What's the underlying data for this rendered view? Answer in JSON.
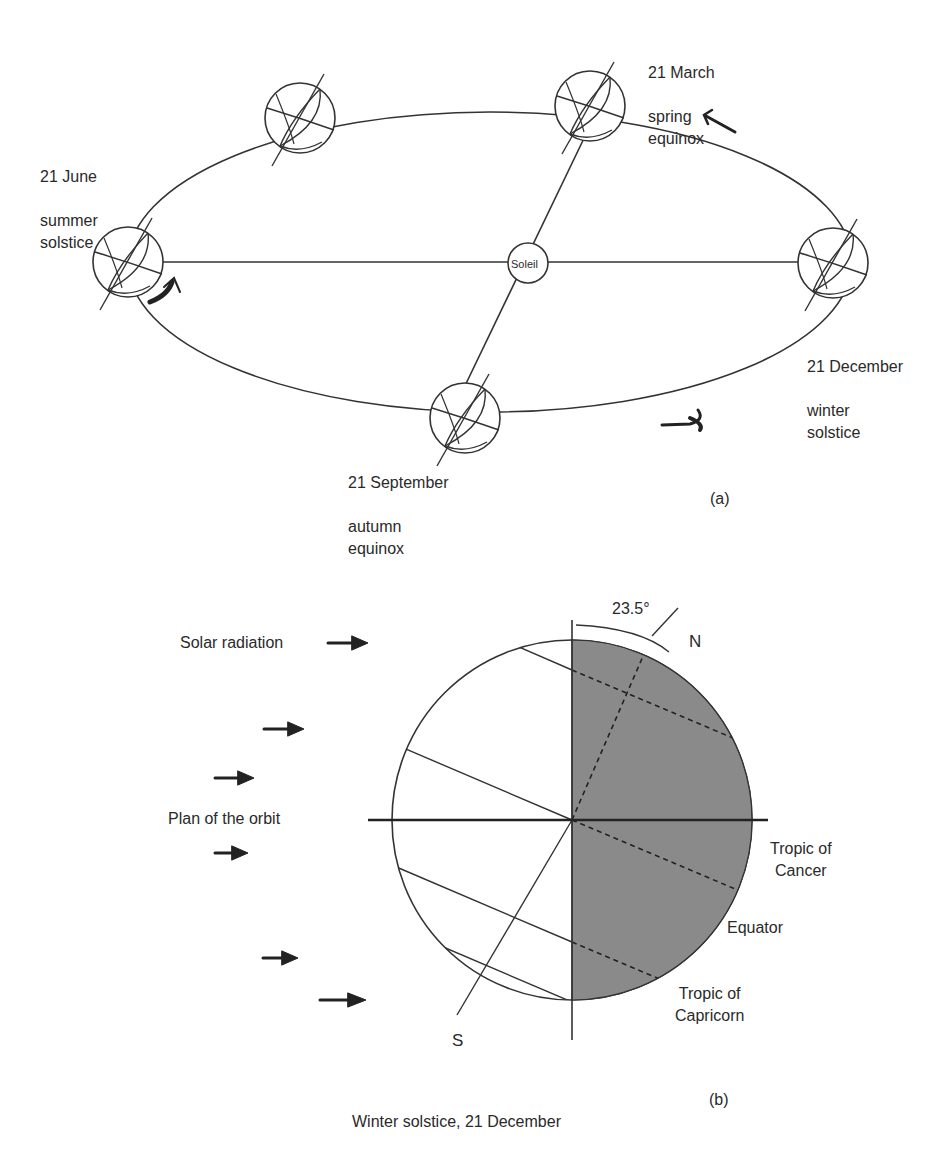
{
  "figure_a": {
    "panel_label": "(a)",
    "sun_label": "Soleil",
    "positions": [
      {
        "id": "june",
        "date": "21 June",
        "event": "summer\nsolstice"
      },
      {
        "id": "march",
        "date": "21 March",
        "event": "spring\nequinox"
      },
      {
        "id": "december",
        "date": "21 December",
        "event": "winter\nsolstice"
      },
      {
        "id": "september",
        "date": "21 September",
        "event": "autumn\nequinox"
      }
    ]
  },
  "figure_b": {
    "panel_label": "(b)",
    "caption": "Winter solstice, 21 December",
    "tilt_angle": "23.5°",
    "north_label": "N",
    "south_label": "S",
    "solar_radiation_label": "Solar radiation",
    "orbit_plane_label": "Plan of the orbit",
    "tropic_cancer_label": "Tropic of\nCancer",
    "equator_label": "Equator",
    "tropic_capricorn_label": "Tropic of\nCapricorn"
  },
  "colors": {
    "line": "#333333",
    "night_shade": "#8a8a8a",
    "background": "#ffffff"
  }
}
